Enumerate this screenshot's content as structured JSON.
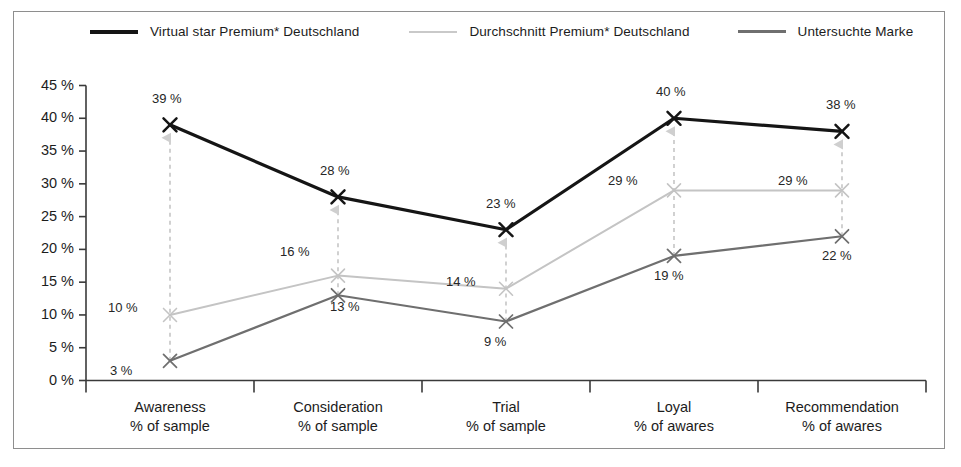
{
  "chart_data": {
    "type": "line",
    "title": "",
    "subtitle": "",
    "xlabel": "",
    "ylabel": "",
    "ylim": [
      0,
      45
    ],
    "ytick_values": [
      0,
      5,
      10,
      15,
      20,
      25,
      30,
      35,
      40,
      45
    ],
    "ytick_labels": [
      "0 %",
      "5 %",
      "10 %",
      "15 %",
      "20 %",
      "25 %",
      "30 %",
      "35 %",
      "40 %",
      "45 %"
    ],
    "grid": false,
    "legend_position": "top",
    "marker": "x",
    "categories": [
      "Awareness\n% of sample",
      "Consideration\n% of sample",
      "Trial\n% of sample",
      "Loyal\n% of awares",
      "Recommendation\n% of awares"
    ],
    "category_lines": [
      [
        "Awareness",
        "% of sample"
      ],
      [
        "Consideration",
        "% of sample"
      ],
      [
        "Trial",
        "% of sample"
      ],
      [
        "Loyal",
        "% of awares"
      ],
      [
        "Recommendation",
        "% of awares"
      ]
    ],
    "series": [
      {
        "name": "Virtual star Premium* Deutschland",
        "color": "#151515",
        "width": 3.2,
        "values": [
          39,
          28,
          23,
          40,
          38
        ],
        "labels": [
          "39 %",
          "28 %",
          "23 %",
          "40 %",
          "38 %"
        ]
      },
      {
        "name": "Durchschnitt Premium* Deutschland",
        "color": "#c4c4c4",
        "width": 2.0,
        "values": [
          10,
          16,
          14,
          29,
          29
        ],
        "labels": [
          "10 %",
          "16 %",
          "14 %",
          "29 %",
          "29 %"
        ]
      },
      {
        "name": "Untersuchte Marke",
        "color": "#6f6f6f",
        "width": 2.2,
        "values": [
          3,
          13,
          9,
          19,
          22
        ],
        "labels": [
          "3 %",
          "13 %",
          "9 %",
          "19 %",
          "22 %"
        ]
      }
    ],
    "annotations": {
      "type": "gap-arrow",
      "style": "dashed-upward-arrow",
      "color": "#c9c9c9",
      "description": "Dashed vertical arrows at each category pointing from the 'Untersuchte Marke' value up to the 'Virtual star Premium* Deutschland' value",
      "items": [
        {
          "category": "Awareness",
          "from": 3,
          "to": 39
        },
        {
          "category": "Consideration",
          "from": 13,
          "to": 28
        },
        {
          "category": "Trial",
          "from": 9,
          "to": 23
        },
        {
          "category": "Loyal",
          "from": 19,
          "to": 40
        },
        {
          "category": "Recommendation",
          "from": 22,
          "to": 38
        }
      ]
    }
  },
  "legend": {
    "items": [
      {
        "label": "Virtual star Premium* Deutschland",
        "color": "#151515"
      },
      {
        "label": "Durchschnitt Premium* Deutschland",
        "color": "#c4c4c4"
      },
      {
        "label": "Untersuchte Marke",
        "color": "#6f6f6f"
      }
    ]
  },
  "axis": {
    "y_labels": [
      "45 %",
      "40 %",
      "35 %",
      "30 %",
      "25 %",
      "20 %",
      "15 %",
      "10 %",
      "5 %",
      "0 %"
    ],
    "x_labels": [
      {
        "line1": "Awareness",
        "line2": "% of sample"
      },
      {
        "line1": "Consideration",
        "line2": "% of sample"
      },
      {
        "line1": "Trial",
        "line2": "% of sample"
      },
      {
        "line1": "Loyal",
        "line2": "% of awares"
      },
      {
        "line1": "Recommendation",
        "line2": "% of awares"
      }
    ],
    "axis_color": "#3a3a3a"
  },
  "data_labels": {
    "s0": [
      "39 %",
      "28 %",
      "23 %",
      "40 %",
      "38 %"
    ],
    "s1": [
      "10 %",
      "16 %",
      "14 %",
      "29 %",
      "29 %"
    ],
    "s2": [
      "3 %",
      "13 %",
      "9 %",
      "19 %",
      "22 %"
    ]
  }
}
